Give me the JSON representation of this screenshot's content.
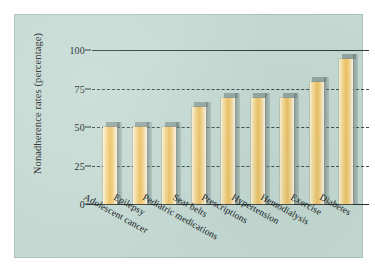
{
  "figure": {
    "background_color": "#ffffff",
    "panel_color": "#c4d9d2",
    "bar_color": "#edbf62",
    "bar_highlight_color": "#fdf3da",
    "axis_color": "#222b2e"
  },
  "chart_data": {
    "type": "bar",
    "title": "",
    "xlabel": "",
    "ylabel": "Nonadherence rates (percentage)",
    "categories": [
      "Adolescent cancer",
      "Epilepsy",
      "Pediatric medications",
      "Seat belts",
      "Prescriptions",
      "Hypertension",
      "Hemodialysis",
      "Exercise",
      "Diabetes"
    ],
    "values": [
      50,
      50,
      50,
      63,
      69,
      69,
      69,
      79,
      94
    ],
    "ylim": [
      0,
      100
    ],
    "yticks": [
      0,
      25,
      50,
      75,
      100
    ],
    "ytick_labels": [
      "0",
      "25",
      "50",
      "75",
      "100"
    ],
    "grid": true,
    "legend": null,
    "orientation": "vertical"
  }
}
